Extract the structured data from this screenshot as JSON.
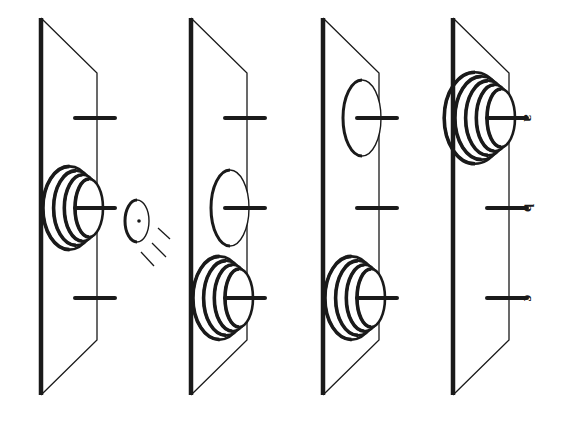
{
  "figure": {
    "panels": [
      {
        "id": 1,
        "pegs": [
          "peg",
          "peg",
          "peg"
        ],
        "features": [
          {
            "peg": 1,
            "type": "rings",
            "count": 4
          },
          {
            "type": "incoming-disc",
            "near_peg": 1
          }
        ]
      },
      {
        "id": 2,
        "features": [
          {
            "peg": 1,
            "type": "ellipse"
          },
          {
            "peg": 2,
            "type": "rings",
            "count": 4
          }
        ]
      },
      {
        "id": 3,
        "features": [
          {
            "peg": 0,
            "type": "ellipse"
          },
          {
            "peg": 2,
            "type": "rings",
            "count": 4
          }
        ]
      },
      {
        "id": 4,
        "features": [
          {
            "peg": 0,
            "type": "rings",
            "count": 5
          }
        ]
      }
    ],
    "labels": [
      "a",
      "b",
      "c"
    ],
    "colors": {
      "ink": "#1a1a1a",
      "background": "#ffffff"
    }
  }
}
